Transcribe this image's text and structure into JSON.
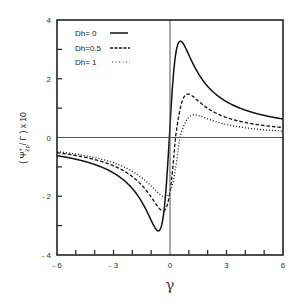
{
  "chart_data": {
    "type": "line",
    "title": "",
    "xlabel": "γ",
    "ylabel": "( Ψ⁺₂ₚ / Γ ) x 10",
    "xlim": [
      -6,
      6
    ],
    "ylim": [
      -4,
      4
    ],
    "x_ticks": [
      "- 6",
      "- 3",
      "0",
      "3",
      "6"
    ],
    "y_ticks": [
      "4",
      "2",
      "0",
      "- 2",
      "- 4"
    ],
    "grid": false,
    "legend_position": "upper-left",
    "series": [
      {
        "name": "Dh= 0",
        "style": "solid",
        "peak": {
          "x": 0.55,
          "y": 3.28
        },
        "trough": {
          "x": -0.62,
          "y": -3.18
        }
      },
      {
        "name": "Dh=0.5",
        "style": "dashed",
        "peak": {
          "x": 0.95,
          "y": 1.48
        },
        "trough": {
          "x": -0.37,
          "y": -2.5
        }
      },
      {
        "name": "Dh= 1",
        "style": "dotted",
        "peak": {
          "x": 1.3,
          "y": 0.77
        },
        "trough": {
          "x": -0.27,
          "y": -2.02
        }
      }
    ]
  },
  "legend": [
    {
      "label": "Dh= 0"
    },
    {
      "label": "Dh=0.5"
    },
    {
      "label": "Dh= 1"
    }
  ],
  "axes": {
    "x_label": "γ",
    "y_label": "( Ψ⁺₂ₚ / Γ ) x 10"
  }
}
